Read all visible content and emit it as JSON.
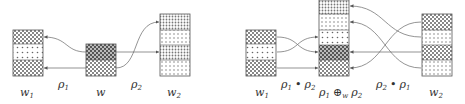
{
  "left_diagram": {
    "boxes": [
      {
        "id": "w1",
        "label": "w",
        "subscript": "1",
        "segments": [
          "checker",
          "dots-sparse",
          "checker"
        ]
      },
      {
        "id": "w",
        "label": "w",
        "subscript": "",
        "segments": [
          "checker-dark",
          "checker"
        ]
      },
      {
        "id": "w2",
        "label": "w",
        "subscript": "2",
        "segments": [
          "dots-dense",
          "dots",
          "dots-dense",
          "dots"
        ]
      }
    ],
    "arrow_labels": [
      {
        "text": "ρ",
        "subscript": "1"
      },
      {
        "text": "ρ",
        "subscript": "2"
      }
    ]
  },
  "right_diagram": {
    "boxes": [
      {
        "id": "w1",
        "label": "w",
        "subscript": "1",
        "segments": [
          "checker",
          "dots-sparse",
          "checker"
        ]
      },
      {
        "id": "merge",
        "label": "ρ₁ ⊕w ρ₂",
        "segments": [
          "dots-dense",
          "dots",
          "dots-sparse",
          "checker-dark",
          "checker"
        ]
      },
      {
        "id": "w2",
        "label": "w",
        "subscript": "2",
        "segments": [
          "checker",
          "dots",
          "checker",
          "dots"
        ]
      }
    ],
    "arrow_labels": [
      {
        "text": "ρ₁ • ρ₂"
      },
      {
        "text": "ρ₂ • ρ₁"
      }
    ],
    "merge_label": {
      "rho1": "ρ",
      "sub1": "1",
      "op": "⊕",
      "op_sub": "w",
      "rho2": "ρ",
      "sub2": "2"
    }
  },
  "labels": {
    "w1": "w",
    "w1_sub": "1",
    "w": "w",
    "w2": "w",
    "w2_sub": "2",
    "rho": "ρ",
    "one": "1",
    "two": "2",
    "bullet": "•",
    "oplus": "⊕",
    "w_sub": "w"
  },
  "colors": {
    "stroke": "#555555",
    "fill_dark": "#777777",
    "fill_mid": "#999999",
    "line": "#666666"
  }
}
